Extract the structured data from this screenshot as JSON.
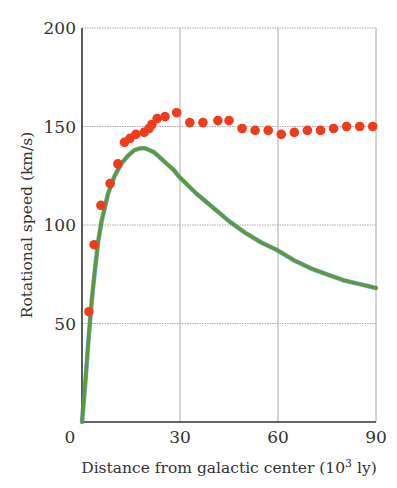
{
  "chart_data": {
    "type": "scatter",
    "title": "",
    "xlabel": "Distance from galactic center (10³ ly)",
    "xlabel_main": "Distance from galactic center (10",
    "xlabel_sup": "3",
    "xlabel_tail": " ly)",
    "ylabel": "Rotational speed (km/s)",
    "xlim": [
      0,
      90
    ],
    "ylim": [
      0,
      200
    ],
    "xticks": [
      0,
      30,
      60,
      90
    ],
    "yticks": [
      50,
      100,
      150,
      200
    ],
    "xtick_labels": [
      "0",
      "30",
      "60",
      "90"
    ],
    "ytick_labels": [
      "50",
      "100",
      "150",
      "200"
    ],
    "grid": true,
    "legend": null,
    "colors": {
      "observed": "#f03c1c",
      "curve": "#5c9a32",
      "curve_edge": "#4a86b0",
      "grid": "#aaaaaa",
      "axis": "#333333"
    },
    "series": [
      {
        "name": "Observed rotation speed",
        "type": "scatter",
        "x": [
          2.1,
          3.7,
          5.8,
          8.6,
          11,
          13,
          14.7,
          16.5,
          19,
          20.5,
          21.4,
          23,
          25.4,
          29,
          33,
          37,
          41.6,
          45,
          49,
          53,
          57,
          61,
          65,
          69,
          73,
          77,
          81,
          85,
          89
        ],
        "y": [
          56,
          90,
          110,
          121,
          131,
          142,
          144,
          146,
          147,
          149,
          151,
          154,
          155,
          157,
          152,
          152,
          153,
          153,
          149,
          148,
          148,
          146,
          147,
          148,
          148,
          149,
          150,
          150,
          150
        ]
      },
      {
        "name": "Expected (visible mass) curve",
        "type": "line",
        "x": [
          0,
          1,
          2,
          3,
          4,
          5,
          6,
          8,
          10,
          12,
          14,
          16,
          18,
          19,
          20,
          22,
          24,
          26,
          28,
          30,
          35,
          40,
          45,
          50,
          55,
          60,
          65,
          70,
          75,
          80,
          85,
          90
        ],
        "y": [
          0,
          20,
          42,
          62,
          78,
          92,
          102,
          116,
          125,
          131,
          135,
          138,
          139,
          139,
          138.5,
          137,
          134,
          131,
          128,
          124,
          116,
          109,
          102,
          96,
          91,
          87,
          82,
          78,
          75,
          72,
          70,
          68
        ]
      }
    ]
  }
}
